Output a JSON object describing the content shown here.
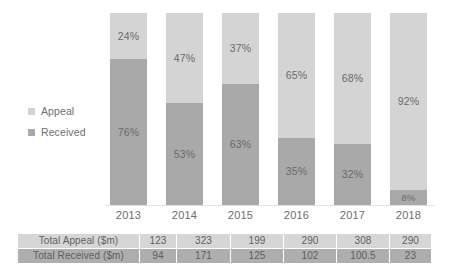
{
  "chart_data": {
    "type": "bar",
    "subtype": "stacked-percentage",
    "title": "",
    "xlabel": "",
    "ylabel": "",
    "ylim": [
      0,
      100
    ],
    "grid": false,
    "legend_position": "left",
    "categories": [
      "2013",
      "2014",
      "2015",
      "2016",
      "2017",
      "2018"
    ],
    "series": [
      {
        "name": "Appeal",
        "color": "#d4d4d4",
        "values": [
          24,
          47,
          37,
          65,
          68,
          92
        ],
        "value_labels": [
          "24%",
          "47%",
          "37%",
          "65%",
          "68%",
          "92%"
        ]
      },
      {
        "name": "Received",
        "color": "#a9a9a9",
        "values": [
          76,
          53,
          63,
          35,
          32,
          8
        ],
        "value_labels": [
          "76%",
          "53%",
          "63%",
          "35%",
          "32%",
          "8%"
        ]
      }
    ],
    "table": {
      "row_headers": [
        "Total Appeal ($m)",
        "Total Received ($m)"
      ],
      "column_headers": [
        "2013",
        "2014",
        "2015",
        "2016",
        "2017",
        "2018"
      ],
      "rows": [
        {
          "label": "Total Appeal ($m)",
          "values": [
            "123",
            "323",
            "199",
            "290",
            "308",
            "290"
          ]
        },
        {
          "label": "Total Received ($m)",
          "values": [
            "94",
            "171",
            "125",
            "102",
            "100.5",
            "23"
          ]
        }
      ]
    }
  },
  "legend": {
    "items": [
      {
        "label": "Appeal",
        "color": "#d4d4d4"
      },
      {
        "label": "Received",
        "color": "#a9a9a9"
      }
    ]
  },
  "colors": {
    "appeal": "#d4d4d4",
    "received": "#a9a9a9",
    "table_appeal_row": "#d6d6d6",
    "table_received_row": "#aeaeae",
    "text": "#6b6b6b",
    "baseline": "#e3e3e3",
    "background": "#ffffff"
  }
}
